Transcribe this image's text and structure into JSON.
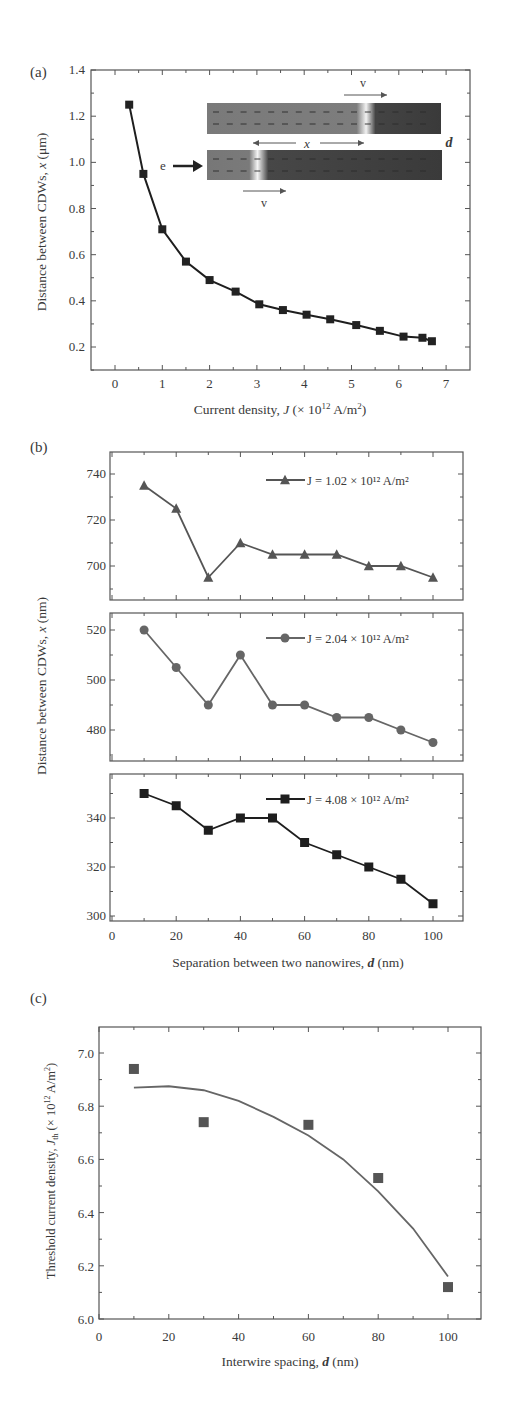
{
  "chart_data": [
    {
      "panel": "(a)",
      "type": "line",
      "xlabel": "Current density, J (× 10^12 A/m^2)",
      "ylabel": "Distance between CDWs, x (μm)",
      "xlim": [
        -0.5,
        7.5
      ],
      "ylim": [
        0.1,
        1.4
      ],
      "xticks": [
        0,
        1,
        2,
        3,
        4,
        5,
        6,
        7
      ],
      "yticks": [
        0.2,
        0.4,
        0.6,
        0.8,
        1.0,
        1.2,
        1.4
      ],
      "grid": false,
      "series": [
        {
          "name": "x vs J",
          "marker": "square",
          "x": [
            0.3,
            0.6,
            1.0,
            1.5,
            2.0,
            2.55,
            3.05,
            3.55,
            4.05,
            4.55,
            5.1,
            5.6,
            6.1,
            6.5,
            6.7
          ],
          "y": [
            1.25,
            0.95,
            0.71,
            0.57,
            0.49,
            0.44,
            0.385,
            0.36,
            0.34,
            0.32,
            0.295,
            0.27,
            0.245,
            0.24,
            0.225
          ]
        }
      ],
      "inset": {
        "labels": {
          "v_top": "v",
          "x": "x",
          "d": "d",
          "e": "e",
          "v_bottom": "v"
        }
      }
    },
    {
      "panel": "(b)",
      "type": "line",
      "xlabel": "Separation between two nanowires, d (nm)",
      "ylabel": "Distance between CDWs, x (nm)",
      "xlim": [
        -2,
        110
      ],
      "xticks": [
        0,
        20,
        40,
        60,
        80,
        100
      ],
      "grid": false,
      "subplots": [
        {
          "legend": "J = 1.02 × 10^12 A/m^2",
          "marker": "triangle",
          "ylim": [
            684,
            750
          ],
          "yticks": [
            700,
            720,
            740
          ],
          "x": [
            10,
            20,
            30,
            40,
            50,
            60,
            70,
            80,
            90,
            100
          ],
          "y": [
            735,
            725,
            695,
            710,
            705,
            705,
            705,
            700,
            700,
            695
          ]
        },
        {
          "legend": "J = 2.04 × 10^12 A/m^2",
          "marker": "circle",
          "ylim": [
            468,
            527
          ],
          "yticks": [
            480,
            500,
            520
          ],
          "x": [
            10,
            20,
            30,
            40,
            50,
            60,
            70,
            80,
            90,
            100
          ],
          "y": [
            520,
            505,
            490,
            510,
            490,
            490,
            485,
            485,
            480,
            475
          ]
        },
        {
          "legend": "J = 4.08 × 10^12 A/m^2",
          "marker": "square",
          "ylim": [
            298,
            358
          ],
          "yticks": [
            300,
            320,
            340
          ],
          "x": [
            10,
            20,
            30,
            40,
            50,
            60,
            70,
            80,
            90,
            100
          ],
          "y": [
            350,
            345,
            335,
            340,
            340,
            330,
            325,
            320,
            315,
            305
          ]
        }
      ]
    },
    {
      "panel": "(c)",
      "type": "scatter",
      "xlabel": "Interwire spacing, d (nm)",
      "ylabel": "Threshold current density, J_th (× 10^12 A/m^2)",
      "xlim": [
        0,
        110
      ],
      "ylim": [
        6.0,
        7.1
      ],
      "xticks": [
        0,
        20,
        40,
        60,
        80,
        100
      ],
      "yticks": [
        6.0,
        6.2,
        6.4,
        6.6,
        6.8,
        7.0
      ],
      "grid": false,
      "series": [
        {
          "name": "data",
          "marker": "square",
          "x": [
            10,
            30,
            60,
            80,
            100
          ],
          "y": [
            6.94,
            6.74,
            6.73,
            6.53,
            6.12
          ]
        },
        {
          "name": "fit",
          "marker": "none",
          "x": [
            10,
            20,
            30,
            40,
            50,
            60,
            70,
            80,
            90,
            100
          ],
          "y": [
            6.87,
            6.875,
            6.86,
            6.82,
            6.76,
            6.69,
            6.6,
            6.48,
            6.34,
            6.16
          ]
        }
      ]
    }
  ],
  "labels": {
    "a": "(a)",
    "b": "(b)",
    "c": "(c)",
    "a_xlabel_pre": "Current density, ",
    "a_xlabel_var": "J",
    "a_xlabel_post": " (× 10",
    "a_xlabel_exp": "12",
    "a_xlabel_end": " A/m",
    "a_xlabel_sq": "2",
    "a_xlabel_close": ")",
    "a_ylabel": "Distance between CDWs, x (μm)",
    "b_xlabel_pre": "Separation between two nanowires, ",
    "b_xlabel_var": "d",
    "b_xlabel_post": " (nm)",
    "b_ylabel": "Distance between CDWs, x (nm)",
    "c_xlabel_pre": "Interwire spacing, ",
    "c_xlabel_var": "d",
    "c_xlabel_post": " (nm)",
    "c_ylabel": "Threshold current density, J_th (× 10^12 A/m^2)",
    "legend1": "J = 1.02 × 10¹² A/m²",
    "legend2": "J = 2.04 × 10¹² A/m²",
    "legend3": "J = 4.08 × 10¹² A/m²",
    "inset_v": "v",
    "inset_x": "x",
    "inset_d": "d",
    "inset_e": "e"
  }
}
